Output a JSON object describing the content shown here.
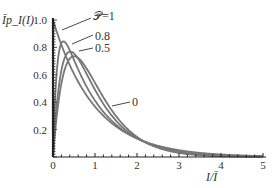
{
  "chart_data": {
    "type": "line",
    "title": "",
    "xlabel": "I/Ī",
    "ylabel": "Īp_I(I)",
    "xlim": [
      0,
      5
    ],
    "ylim": [
      0,
      1.0
    ],
    "xticks": [
      "0",
      "1",
      "2",
      "3",
      "4",
      "5"
    ],
    "yticks": [
      "0.2",
      "0.4",
      "0.6",
      "0.8",
      "1.0"
    ],
    "grid": false,
    "series": [
      {
        "name": "P=1",
        "P": 1.0,
        "label": "𝒫=1"
      },
      {
        "name": "P=0.8",
        "P": 0.8,
        "label": "0.8"
      },
      {
        "name": "P=0.5",
        "P": 0.5,
        "label": "0.5"
      },
      {
        "name": "P=0",
        "P": 0.0,
        "label": "0"
      }
    ],
    "peaks": [
      {
        "name": "P=1",
        "x": 0.0,
        "y": 1.0
      },
      {
        "name": "P=0.8",
        "x": 0.27,
        "y": 0.83
      },
      {
        "name": "P=0.5",
        "x": 0.37,
        "y": 0.77
      },
      {
        "name": "P=0",
        "x": 0.5,
        "y": 0.74
      }
    ]
  },
  "labels": {
    "ylabel": "Īp_I(I)",
    "xlabel": "I/Ī",
    "p1": "𝒫=1",
    "p08": "0.8",
    "p05": "0.5",
    "p0": "0"
  },
  "colors": {
    "curve": "#777777",
    "axis": "#222222"
  }
}
